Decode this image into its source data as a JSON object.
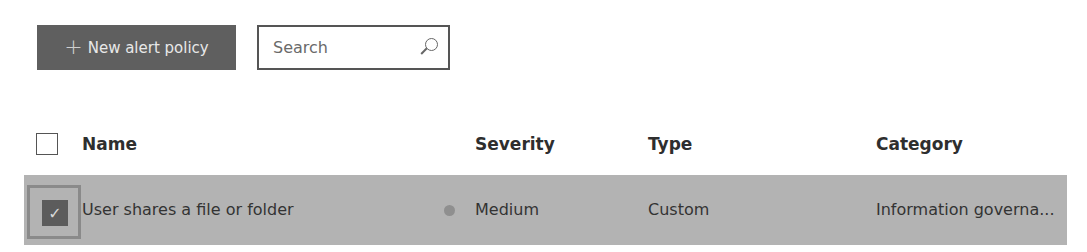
{
  "toolbar": {
    "new_button_icon": "plus-icon",
    "new_button_label": "New alert policy",
    "search_placeholder": "Search",
    "search_icon": "search-icon"
  },
  "table": {
    "columns": [
      {
        "label": "Name"
      },
      {
        "label": "Severity"
      },
      {
        "label": "Type"
      },
      {
        "label": "Category"
      }
    ],
    "rows": [
      {
        "selected": true,
        "name": "User shares a file or folder",
        "severity": "Medium",
        "severity_color": "#8f8f8f",
        "type": "Custom",
        "category": "Information governa..."
      }
    ]
  }
}
